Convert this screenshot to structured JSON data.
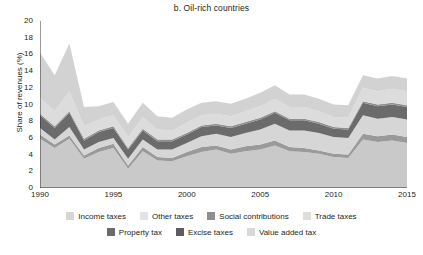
{
  "chart_data": {
    "type": "area",
    "stacked": true,
    "title": "b. Oil-rich countries",
    "xlabel": "",
    "ylabel": "Share of revenues (%)",
    "xlim": [
      1990,
      2015
    ],
    "ylim": [
      0,
      20
    ],
    "ytick_step": 2,
    "grid": false,
    "legend_position": "bottom",
    "x": [
      1990,
      1991,
      1992,
      1993,
      1994,
      1995,
      1996,
      1997,
      1998,
      1999,
      2000,
      2001,
      2002,
      2003,
      2004,
      2005,
      2006,
      2007,
      2008,
      2009,
      2010,
      2011,
      2012,
      2013,
      2014,
      2015
    ],
    "xticks": [
      "1990",
      "1995",
      "2000",
      "2005",
      "2010",
      "2015"
    ],
    "yticks": [
      "0",
      "2",
      "4",
      "6",
      "8",
      "10",
      "12",
      "14",
      "16",
      "18",
      "20"
    ],
    "series": [
      {
        "name": "Value added tax",
        "color": "#c9c9c9",
        "values": [
          5.9,
          4.8,
          5.9,
          3.5,
          4.3,
          4.8,
          2.3,
          4.4,
          3.3,
          3.2,
          3.8,
          4.3,
          4.6,
          4.1,
          4.4,
          4.6,
          5.1,
          4.4,
          4.3,
          4.1,
          3.7,
          3.6,
          5.8,
          5.5,
          5.7,
          5.4
        ]
      },
      {
        "name": "Excise taxes",
        "color": "#9a9a9a",
        "values": [
          0.5,
          0.4,
          0.4,
          0.4,
          0.5,
          0.5,
          0.4,
          0.5,
          0.4,
          0.4,
          0.5,
          0.6,
          0.5,
          0.5,
          0.6,
          0.6,
          0.6,
          0.5,
          0.5,
          0.4,
          0.4,
          0.4,
          0.7,
          0.7,
          0.7,
          0.7
        ]
      },
      {
        "name": "Income taxes",
        "color": "#d6d6d6",
        "values": [
          0.8,
          0.6,
          1.0,
          0.7,
          0.7,
          0.7,
          0.8,
          0.9,
          0.9,
          1.0,
          1.1,
          1.3,
          1.4,
          1.5,
          1.6,
          1.8,
          2.0,
          2.0,
          2.1,
          2.1,
          2.0,
          2.0,
          2.2,
          2.1,
          2.1,
          2.1
        ]
      },
      {
        "name": "Property tax",
        "color": "#6b6b6b",
        "values": [
          1.5,
          1.4,
          1.7,
          1.1,
          1.2,
          1.2,
          1.1,
          1.1,
          1.0,
          1.0,
          1.0,
          1.1,
          1.0,
          1.1,
          1.1,
          1.2,
          1.3,
          1.2,
          1.2,
          1.1,
          1.0,
          1.0,
          1.5,
          1.5,
          1.5,
          1.5
        ]
      },
      {
        "name": "Social contributions",
        "color": "#8f8f8f",
        "values": [
          0.2,
          0.2,
          0.2,
          0.2,
          0.2,
          0.2,
          0.2,
          0.2,
          0.2,
          0.2,
          0.2,
          0.2,
          0.2,
          0.2,
          0.2,
          0.2,
          0.2,
          0.2,
          0.2,
          0.2,
          0.2,
          0.2,
          0.2,
          0.2,
          0.2,
          0.2
        ]
      },
      {
        "name": "Trade taxes",
        "color": "#dcdcdc",
        "values": [
          1.9,
          1.8,
          2.4,
          1.5,
          1.3,
          1.3,
          1.3,
          1.4,
          1.2,
          1.1,
          1.2,
          1.2,
          1.2,
          1.2,
          1.3,
          1.4,
          1.5,
          1.4,
          1.4,
          1.3,
          1.2,
          1.2,
          1.6,
          1.6,
          1.7,
          1.7
        ]
      },
      {
        "name": "Other taxes",
        "color": "#d2d2d2",
        "values": [
          5.4,
          4.3,
          5.7,
          2.3,
          1.6,
          1.6,
          1.6,
          1.7,
          1.6,
          1.5,
          1.6,
          1.5,
          1.5,
          1.5,
          1.5,
          1.6,
          1.6,
          1.5,
          1.5,
          1.5,
          1.5,
          1.5,
          1.5,
          1.5,
          1.5,
          1.5
        ]
      }
    ],
    "totals": [
      16.2,
      13.5,
      17.3,
      9.7,
      9.8,
      10.3,
      7.7,
      10.2,
      8.6,
      8.4,
      9.4,
      10.2,
      10.4,
      10.1,
      10.7,
      11.4,
      12.3,
      11.2,
      11.2,
      10.7,
      10.0,
      9.9,
      13.5,
      13.1,
      13.4,
      13.1
    ]
  },
  "chart": {
    "title": "b. Oil-rich countries",
    "y_axis_title": "Share of revenues (%)"
  },
  "legend": {
    "row1": [
      {
        "label": "Income taxes",
        "color": "#d6d6d6"
      },
      {
        "label": "Other taxes",
        "color": "#e4e4e4"
      },
      {
        "label": "Social contributions",
        "color": "#8f8f8f"
      },
      {
        "label": "Trade taxes",
        "color": "#dcdcdc"
      }
    ],
    "row2": [
      {
        "label": "Property tax",
        "color": "#6b6b6b"
      },
      {
        "label": "Excise taxes",
        "color": "#5e5e5e"
      },
      {
        "label": "Value added tax",
        "color": "#d9d9d9"
      }
    ]
  }
}
